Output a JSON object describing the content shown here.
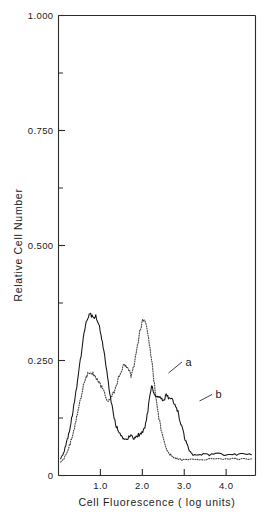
{
  "chart_data": {
    "type": "line",
    "title": "",
    "subtitle": "",
    "xlabel": "Cell Fluorescence ( log units)",
    "ylabel": "Relative Cell Number",
    "xlim": [
      0.0,
      4.7
    ],
    "ylim": [
      0.0,
      1.0
    ],
    "grid": false,
    "legend_position": "inline-annotation",
    "x_ticks": [
      {
        "value": 1.0,
        "label": "1.0",
        "type": "major"
      },
      {
        "value": 2.0,
        "label": "2.0",
        "type": "major"
      },
      {
        "value": 3.0,
        "label": "3.0",
        "type": "major"
      },
      {
        "value": 4.0,
        "label": "4.0",
        "type": "major"
      }
    ],
    "y_ticks": [
      {
        "value": 0.0,
        "label": "0",
        "type": "major"
      },
      {
        "value": 0.125,
        "label": "",
        "type": "minor"
      },
      {
        "value": 0.25,
        "label": "0.250",
        "type": "major"
      },
      {
        "value": 0.375,
        "label": "",
        "type": "minor"
      },
      {
        "value": 0.5,
        "label": "0.500",
        "type": "major"
      },
      {
        "value": 0.625,
        "label": "",
        "type": "minor"
      },
      {
        "value": 0.75,
        "label": "0.750",
        "type": "major"
      },
      {
        "value": 0.875,
        "label": "",
        "type": "minor"
      },
      {
        "value": 1.0,
        "label": "1.000",
        "type": "major"
      }
    ],
    "annotations": [
      {
        "text": "a",
        "x": 2.62,
        "y": 0.258,
        "points_to_series": "a"
      },
      {
        "text": "b",
        "x": 3.02,
        "y": 0.186,
        "points_to_series": "b"
      }
    ],
    "series": [
      {
        "name": "a",
        "style": "dotted",
        "color": "#4a4a4a",
        "x": [
          0.05,
          0.12,
          0.19,
          0.26,
          0.33,
          0.4,
          0.47,
          0.54,
          0.61,
          0.68,
          0.75,
          0.82,
          0.89,
          0.96,
          1.03,
          1.1,
          1.17,
          1.24,
          1.31,
          1.38,
          1.45,
          1.52,
          1.59,
          1.66,
          1.73,
          1.8,
          1.87,
          1.94,
          2.01,
          2.08,
          2.15,
          2.22,
          2.29,
          2.36,
          2.43,
          2.5,
          2.57,
          2.64,
          2.71,
          2.78,
          2.85,
          2.92,
          2.99,
          3.1,
          3.25,
          3.45,
          3.7,
          4.0,
          4.3,
          4.6
        ],
        "y": [
          0.03,
          0.036,
          0.048,
          0.064,
          0.085,
          0.112,
          0.142,
          0.172,
          0.2,
          0.218,
          0.225,
          0.222,
          0.215,
          0.203,
          0.192,
          0.178,
          0.165,
          0.168,
          0.178,
          0.196,
          0.218,
          0.234,
          0.24,
          0.232,
          0.218,
          0.236,
          0.276,
          0.312,
          0.338,
          0.332,
          0.3,
          0.252,
          0.196,
          0.146,
          0.108,
          0.08,
          0.06,
          0.048,
          0.042,
          0.038,
          0.036,
          0.035,
          0.034,
          0.034,
          0.035,
          0.035,
          0.036,
          0.036,
          0.036,
          0.036
        ]
      },
      {
        "name": "b",
        "style": "solid",
        "color": "#141414",
        "x": [
          0.05,
          0.12,
          0.19,
          0.26,
          0.33,
          0.4,
          0.47,
          0.54,
          0.61,
          0.68,
          0.75,
          0.82,
          0.89,
          0.96,
          1.03,
          1.1,
          1.17,
          1.24,
          1.31,
          1.38,
          1.45,
          1.52,
          1.59,
          1.66,
          1.73,
          1.8,
          1.87,
          1.94,
          2.01,
          2.08,
          2.15,
          2.22,
          2.29,
          2.36,
          2.43,
          2.5,
          2.57,
          2.64,
          2.71,
          2.78,
          2.85,
          2.92,
          2.99,
          3.06,
          3.13,
          3.2,
          3.3,
          3.45,
          3.6,
          3.8,
          4.0,
          4.2,
          4.4,
          4.6
        ],
        "y": [
          0.036,
          0.048,
          0.07,
          0.098,
          0.132,
          0.172,
          0.215,
          0.262,
          0.308,
          0.338,
          0.352,
          0.342,
          0.348,
          0.33,
          0.3,
          0.262,
          0.216,
          0.168,
          0.132,
          0.108,
          0.092,
          0.084,
          0.08,
          0.082,
          0.086,
          0.082,
          0.086,
          0.09,
          0.094,
          0.112,
          0.152,
          0.196,
          0.178,
          0.168,
          0.172,
          0.16,
          0.176,
          0.166,
          0.164,
          0.158,
          0.138,
          0.112,
          0.088,
          0.068,
          0.054,
          0.046,
          0.044,
          0.046,
          0.045,
          0.047,
          0.045,
          0.046,
          0.046,
          0.045
        ]
      }
    ]
  },
  "figure": {
    "background": "#ffffff",
    "frame_color": "#2b2b2b"
  }
}
